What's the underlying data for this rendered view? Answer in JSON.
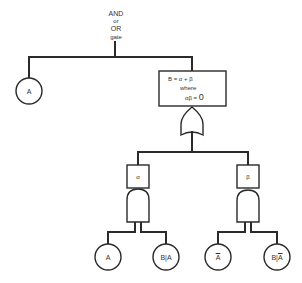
{
  "header": {
    "line1": "AND",
    "line2": "or",
    "line3": "OR",
    "line4": "gate"
  },
  "top_event": {
    "line1": "B = α + β",
    "line2": "where",
    "line3_prefix": "αβ = ",
    "line3_value": "0"
  },
  "nodes": {
    "top_left": "A",
    "alpha_box": "α",
    "beta_box": "β",
    "alpha_in1": "A",
    "alpha_in2": "B|A",
    "beta_in1_bar": "A",
    "beta_in2_prefix": "B|",
    "beta_in2_bar": "A"
  },
  "colors": {
    "line": "#2a2a2a",
    "background": "#ffffff"
  }
}
